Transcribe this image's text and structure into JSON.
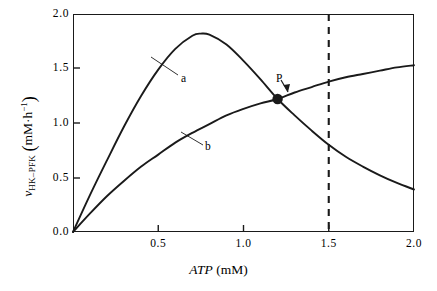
{
  "figure": {
    "background_color": "#ffffff",
    "line_color": "#1a1a1a"
  },
  "axes": {
    "x_title_italic": "ATP",
    "x_title_rest": " (mM)",
    "y_title_symbol": "ν",
    "y_title_subscript": "HK–PFK",
    "y_title_units_open": "(",
    "y_title_units": "mM·h",
    "y_title_units_exp": "−1",
    "y_title_units_close": ")",
    "x_ticks": [
      "0.5",
      "1.0",
      "1.5",
      "2.0"
    ],
    "y_ticks": [
      "0.0",
      "0.5",
      "1.0",
      "1.5",
      "2.0"
    ]
  },
  "annotations": {
    "curve_a_label": "a",
    "curve_b_label": "b",
    "point_label": "P"
  },
  "chart_data": {
    "type": "line",
    "title": "",
    "xlabel": "ATP (mM)",
    "ylabel": "v_HK-PFK (mM·h⁻¹)",
    "xlim": [
      0,
      2.0
    ],
    "ylim": [
      0,
      2.0
    ],
    "xticks": [
      0.5,
      1.0,
      1.5,
      2.0
    ],
    "yticks": [
      0.0,
      0.5,
      1.0,
      1.5,
      2.0
    ],
    "grid": false,
    "legend": "none",
    "series": [
      {
        "name": "a",
        "label": "a",
        "description": "substrate-inhibition curve: rises to a maximum then declines",
        "x": [
          0.0,
          0.1,
          0.2,
          0.3,
          0.4,
          0.5,
          0.6,
          0.7,
          0.75,
          0.8,
          0.9,
          1.0,
          1.1,
          1.2,
          1.3,
          1.4,
          1.5,
          1.6,
          1.7,
          1.8,
          1.9,
          2.0
        ],
        "y": [
          0.0,
          0.34,
          0.66,
          0.97,
          1.25,
          1.49,
          1.68,
          1.8,
          1.82,
          1.81,
          1.72,
          1.57,
          1.4,
          1.22,
          1.07,
          0.93,
          0.8,
          0.69,
          0.6,
          0.52,
          0.45,
          0.39
        ],
        "max": {
          "x": 0.75,
          "y": 1.82
        }
      },
      {
        "name": "b",
        "label": "b",
        "description": "saturating hyperbolic curve, monotonically increasing",
        "x": [
          0.0,
          0.1,
          0.2,
          0.3,
          0.4,
          0.5,
          0.6,
          0.7,
          0.8,
          0.9,
          1.0,
          1.1,
          1.2,
          1.3,
          1.4,
          1.5,
          1.6,
          1.7,
          1.8,
          1.9,
          2.0
        ],
        "y": [
          0.0,
          0.17,
          0.33,
          0.47,
          0.6,
          0.71,
          0.82,
          0.91,
          0.99,
          1.07,
          1.13,
          1.18,
          1.22,
          1.28,
          1.33,
          1.38,
          1.42,
          1.45,
          1.48,
          1.51,
          1.53
        ]
      }
    ],
    "markers": [
      {
        "name": "P",
        "label": "P",
        "x": 1.2,
        "y": 1.22,
        "style": "filled-circle",
        "note": "intersection of curves a and b"
      }
    ],
    "reference_lines": [
      {
        "name": "atp-threshold",
        "orientation": "vertical",
        "x": 1.5,
        "style": "dashed"
      }
    ]
  }
}
